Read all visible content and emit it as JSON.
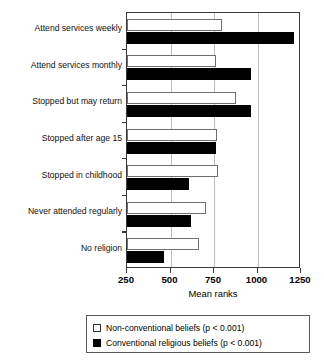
{
  "chart_data": {
    "type": "bar",
    "orientation": "horizontal",
    "title": "",
    "xlabel": "Mean ranks",
    "ylabel": "",
    "xlim": [
      250,
      1250
    ],
    "xticks": [
      250,
      500,
      750,
      1000,
      1250
    ],
    "grid": true,
    "legend_position": "bottom",
    "categories": [
      "Attend services weekly",
      "Attend services monthly",
      "Stopped but may return",
      "Stopped after age 15",
      "Stopped in childhood",
      "Never attended regularly",
      "No religion"
    ],
    "series": [
      {
        "name": "Non-conventional beliefs (p < 0.001)",
        "color": "#ffffff",
        "values": [
          796,
          761,
          877,
          767,
          773,
          704,
          664
        ]
      },
      {
        "name": "Conventional religious beliefs (p < 0.001)",
        "color": "#000000",
        "values": [
          1210,
          963,
          963,
          761,
          606,
          618,
          463
        ]
      }
    ]
  },
  "axis": {
    "x_title": "Mean ranks",
    "tick_labels": [
      "250",
      "500",
      "750",
      "1000",
      "1250"
    ]
  },
  "legend": {
    "items": [
      {
        "label": "Non-conventional beliefs (p < 0.001)",
        "swatch": "white-square"
      },
      {
        "label": "Conventional religious beliefs (p < 0.001)",
        "swatch": "black-square"
      }
    ]
  }
}
